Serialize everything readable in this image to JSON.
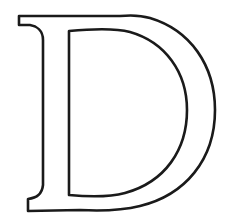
{
  "image": {
    "letter": "D",
    "style": "outlined serif capital letter",
    "stroke_color": "#1a1a1a",
    "fill_color": "#ffffff",
    "background_color": "#ffffff"
  }
}
